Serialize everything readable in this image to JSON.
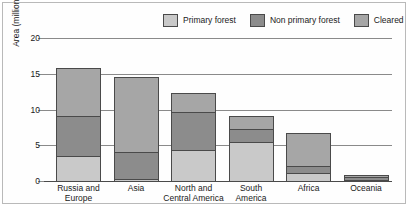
{
  "chart_data": {
    "type": "bar",
    "subtype": "stacked-bar",
    "title": "",
    "xlabel": "",
    "ylabel": "Area (million km2)",
    "ylim": [
      0,
      20
    ],
    "yticks": [
      0,
      5,
      10,
      15,
      20
    ],
    "grid": true,
    "legend_position": "top-right",
    "categories": [
      "Russia and Europe",
      "Asia",
      "North and Central America",
      "South America",
      "Africa",
      "Oceania"
    ],
    "series": [
      {
        "name": "Primary forest",
        "color": "#c9c9c9",
        "values": [
          3.7,
          0.4,
          4.5,
          5.6,
          1.3,
          0.2
        ]
      },
      {
        "name": "Non primary forest",
        "color": "#8c8c8c",
        "values": [
          5.7,
          3.9,
          5.5,
          2.0,
          1.1,
          0.5
        ]
      },
      {
        "name": "Cleared",
        "color": "#a6a6a6",
        "values": [
          6.8,
          10.7,
          2.8,
          1.9,
          4.8,
          0.5
        ]
      }
    ],
    "totals": [
      16.2,
      15.0,
      12.8,
      9.5,
      7.2,
      1.2
    ]
  },
  "legend": {
    "items": [
      {
        "label": "Primary forest",
        "swatch": "legend-swatch-primary-forest"
      },
      {
        "label": "Non primary forest",
        "swatch": "legend-swatch-non-primary-forest"
      },
      {
        "label": "Cleared",
        "swatch": "legend-swatch-cleared"
      }
    ]
  },
  "axis": {
    "y_title_main": "Area (million km",
    "y_title_sub": "2",
    "y_title_end": ")",
    "y_tick_labels": [
      "20",
      "15",
      "10",
      "5",
      "0"
    ]
  },
  "xlabels": [
    [
      "Russia and",
      "Europe"
    ],
    [
      "Asia",
      ""
    ],
    [
      "North and",
      "Central America"
    ],
    [
      "South",
      "America"
    ],
    [
      "Africa",
      ""
    ],
    [
      "Oceania",
      ""
    ]
  ]
}
